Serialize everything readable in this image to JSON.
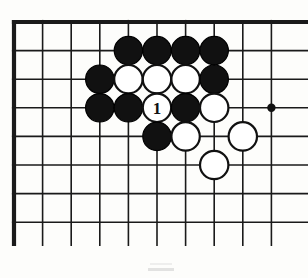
{
  "diagram": {
    "kind": "go-board-diagram",
    "board": {
      "visible_columns": 10,
      "visible_rows": 8,
      "edges_shown": [
        "top",
        "left"
      ],
      "origin_x": 14,
      "origin_y": 22,
      "cell_size": 28.6,
      "line_color": "#1a1a1a",
      "thin_line_width": 1.6,
      "edge_line_width": 4.2,
      "background_color": "#fdfdfb"
    },
    "star_points": [
      {
        "name": "hoshi-4-4",
        "col": 10,
        "row": 4,
        "radius": 4.2,
        "color": "#111111"
      }
    ],
    "colors": {
      "black_stone_fill": "#111111",
      "black_stone_stroke": "#000000",
      "white_stone_fill": "#ffffff",
      "white_stone_stroke": "#111111",
      "label_on_white": "#111111"
    },
    "stone_radius": 14.2,
    "stones": [
      {
        "id": "b-c5-r2",
        "color": "black",
        "col": 5,
        "row": 2,
        "label": ""
      },
      {
        "id": "b-c6-r2",
        "color": "black",
        "col": 6,
        "row": 2,
        "label": ""
      },
      {
        "id": "b-c7-r2",
        "color": "black",
        "col": 7,
        "row": 2,
        "label": ""
      },
      {
        "id": "b-c8-r2",
        "color": "black",
        "col": 8,
        "row": 2,
        "label": ""
      },
      {
        "id": "b-c4-r3",
        "color": "black",
        "col": 4,
        "row": 3,
        "label": ""
      },
      {
        "id": "w-c5-r3",
        "color": "white",
        "col": 5,
        "row": 3,
        "label": ""
      },
      {
        "id": "w-c6-r3",
        "color": "white",
        "col": 6,
        "row": 3,
        "label": ""
      },
      {
        "id": "w-c7-r3",
        "color": "white",
        "col": 7,
        "row": 3,
        "label": ""
      },
      {
        "id": "b-c8-r3",
        "color": "black",
        "col": 8,
        "row": 3,
        "label": ""
      },
      {
        "id": "b-c4-r4",
        "color": "black",
        "col": 4,
        "row": 4,
        "label": ""
      },
      {
        "id": "b-c5-r4",
        "color": "black",
        "col": 5,
        "row": 4,
        "label": ""
      },
      {
        "id": "w-c6-r4",
        "color": "white",
        "col": 6,
        "row": 4,
        "label": "1"
      },
      {
        "id": "b-c7-r4",
        "color": "black",
        "col": 7,
        "row": 4,
        "label": ""
      },
      {
        "id": "w-c8-r4",
        "color": "white",
        "col": 8,
        "row": 4,
        "label": ""
      },
      {
        "id": "b-c6-r5",
        "color": "black",
        "col": 6,
        "row": 5,
        "label": ""
      },
      {
        "id": "w-c7-r5",
        "color": "white",
        "col": 7,
        "row": 5,
        "label": ""
      },
      {
        "id": "w-c9-r5",
        "color": "white",
        "col": 9,
        "row": 5,
        "label": ""
      },
      {
        "id": "w-c8-r6",
        "color": "white",
        "col": 8,
        "row": 6,
        "label": ""
      }
    ],
    "move_markers": [
      {
        "number": "1",
        "player": "white",
        "col": 6,
        "row": 4
      }
    ],
    "footer_artifact": {
      "present": true,
      "description": "faint grey scan smudge near bottom center"
    }
  }
}
